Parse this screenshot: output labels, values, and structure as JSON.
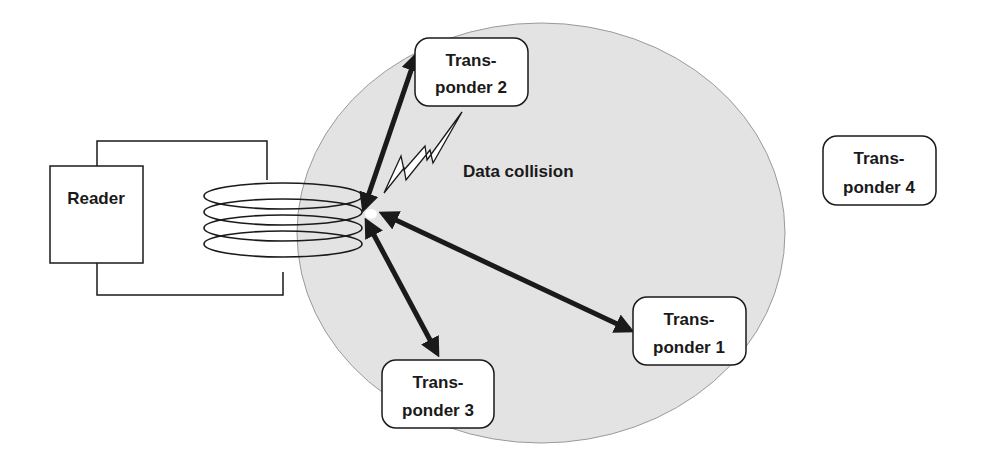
{
  "diagram": {
    "title": "",
    "colors": {
      "field": "#e3e3e3",
      "field_edge": "#9a9a9a",
      "stroke": "#1a1a1a",
      "box_fill": "#ffffff"
    },
    "reader": {
      "label": "Reader"
    },
    "field_annotation": "Data collision",
    "transponders": [
      {
        "id": 1,
        "line1": "Trans-",
        "line2": "ponder 1",
        "in_field": true
      },
      {
        "id": 2,
        "line1": "Trans-",
        "line2": "ponder 2",
        "in_field": true
      },
      {
        "id": 3,
        "line1": "Trans-",
        "line2": "ponder 3",
        "in_field": true
      },
      {
        "id": 4,
        "line1": "Trans-",
        "line2": "ponder 4",
        "in_field": false
      }
    ],
    "connections": [
      {
        "from": "Reader antenna",
        "to": "Transponder 1",
        "type": "bidirectional"
      },
      {
        "from": "Reader antenna",
        "to": "Transponder 2",
        "type": "bidirectional"
      },
      {
        "from": "Reader antenna",
        "to": "Transponder 3",
        "type": "bidirectional"
      }
    ],
    "icons": {
      "collision": "lightning-bolt-icon",
      "antenna": "coil-antenna-icon"
    }
  }
}
